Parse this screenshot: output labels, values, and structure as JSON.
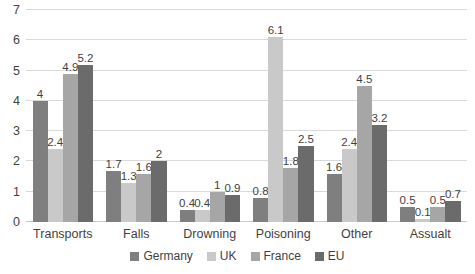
{
  "chart_data": {
    "type": "bar",
    "title": "",
    "subtitle": "",
    "xlabel": "",
    "ylabel": "",
    "ylim": [
      0,
      7
    ],
    "yticks": [
      0,
      1,
      2,
      3,
      4,
      5,
      6,
      7
    ],
    "ytick_labels": [
      "0",
      "1",
      "2",
      "3",
      "4",
      "5",
      "6",
      "7"
    ],
    "grid": true,
    "legend_position": "bottom",
    "categories": [
      "Transports",
      "Falls",
      "Drowning",
      "Poisoning",
      "Other",
      "Assualt"
    ],
    "series": [
      {
        "name": "Germany",
        "color": "#7f7f7f",
        "values": [
          4,
          1.7,
          0.4,
          0.8,
          1.6,
          0.5
        ],
        "labels": [
          "4",
          "1.7",
          "0.4",
          "0.8",
          "1.6",
          "0.5"
        ]
      },
      {
        "name": "UK",
        "color": "#c9c9c9",
        "values": [
          2.4,
          1.3,
          0.4,
          6.1,
          2.4,
          0.1
        ],
        "labels": [
          "2.4",
          "1.3",
          "0.4",
          "6.1",
          "2.4",
          "0.1"
        ]
      },
      {
        "name": "France",
        "color": "#a6a6a6",
        "values": [
          4.9,
          1.6,
          1,
          1.8,
          4.5,
          0.5
        ],
        "labels": [
          "4.9",
          "1.6",
          "1",
          "1.8",
          "4.5",
          "0.5"
        ]
      },
      {
        "name": "EU",
        "color": "#6b6b6b",
        "values": [
          5.2,
          2,
          0.9,
          2.5,
          3.2,
          0.7
        ],
        "labels": [
          "5.2",
          "2",
          "0.9",
          "2.5",
          "3.2",
          "0.7"
        ]
      }
    ]
  },
  "legend": {
    "items": [
      {
        "label": "Germany",
        "color": "#7f7f7f"
      },
      {
        "label": "UK",
        "color": "#c9c9c9"
      },
      {
        "label": "France",
        "color": "#a6a6a6"
      },
      {
        "label": "EU",
        "color": "#6b6b6b"
      }
    ]
  },
  "colors": {
    "gridline": "#d9d9d9",
    "text": "#3f3f3f",
    "background": "#ffffff"
  }
}
